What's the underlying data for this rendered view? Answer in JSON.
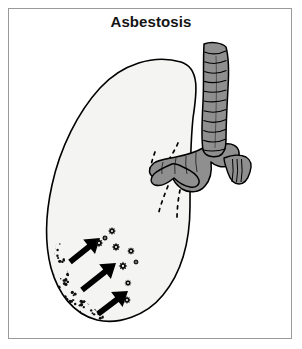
{
  "figure": {
    "title": "Asbestosis",
    "caption_text": "Asbestosis",
    "background_color": "#ffffff",
    "frame_border_color": "#9a9a9a",
    "title_color": "#141414"
  },
  "colors": {
    "lung_fill": "#f4f4f2",
    "lung_outline": "#000000",
    "airway_fill": "#8f8f8f",
    "airway_outline": "#000000",
    "airway_ring_line": "#000000",
    "fibrosis_stipple": "#101010",
    "arrow_fill": "#000000",
    "nodule_fill": "#0d0d0d",
    "nodule_center": "#f4f4f2",
    "dashed_airway_line": "#000000"
  },
  "anatomy": {
    "lung": {
      "label": "left lung (coronal view)",
      "fill": "#f4f4f2",
      "stroke": "#000000",
      "stroke_width": 1.6,
      "path": "M 181 62 C 200 68 197 92 193 118 C 190 148 190 178 190 206 C 190 240 182 272 163 295 C 146 316 118 325 97 320 C 73 314 58 293 51 268 C 44 241 46 212 52 185 C 60 148 78 112 100 88 C 122 64 154 54 181 62 Z"
    },
    "trachea": {
      "label": "trachea",
      "fill": "#8f8f8f",
      "stroke": "#000000",
      "path": "M 204 44 C 212 41 222 43 226 47 C 229 58 229 72 228 88 C 227 106 226 124 226 140 C 226 148 224 154 219 156 C 212 158 205 156 203 150 C 201 138 202 120 203 102 C 204 84 203 62 204 44 Z",
      "ring_count": 11
    },
    "carina": {
      "label": "carina / tracheal bifurcation",
      "fill": "#8f8f8f",
      "stroke": "#000000",
      "path": "M 203 148 C 196 152 186 155 176 157 C 166 159 158 160 154 163 C 149 167 148 173 152 176 C 157 179 164 176 170 172 C 172 178 176 185 182 189 C 190 194 200 192 205 186 C 211 179 212 170 211 162 C 215 166 222 168 229 166 C 236 164 240 158 239 152 C 238 146 232 143 225 144 C 217 145 209 146 203 148 Z"
    },
    "left_main_bronchus": {
      "label": "left main bronchus (entering lung hilum)",
      "fill": "#8f8f8f",
      "stroke": "#000000",
      "path": "M 172 164 C 165 167 158 170 154 174 C 150 178 150 183 155 185 C 161 187 168 183 174 178 C 178 182 184 186 190 187 C 196 188 200 185 199 180 C 197 174 190 170 183 167 C 179 165 175 163 172 164 Z"
    },
    "right_main_bronchus": {
      "label": "right main bronchus",
      "fill": "#8f8f8f",
      "stroke": "#000000",
      "path": "M 224 158 C 231 155 240 154 246 157 C 251 160 252 166 250 172 C 248 179 244 184 239 184 C 234 184 230 179 228 173 C 226 167 224 162 224 158 Z",
      "ring_count": 3
    },
    "intrapulmonary_airways": {
      "label": "dashed intrapulmonary bronchi",
      "stroke": "#000000",
      "dash_pattern": "3 5",
      "paths": [
        "M 178 143 C 174 152 169 160 163 167",
        "M 155 152 C 152 160 150 168 149 175",
        "M 168 186 C 164 196 160 206 158 216",
        "M 180 190 C 178 200 177 210 177 219"
      ]
    }
  },
  "pathology": {
    "fibrosis_band": {
      "label": "basal subpleural fibrosis (stippled band)",
      "description": "dense speckled fibrotic thickening along lower-left pleural border",
      "dot_color": "#101010",
      "region_path": "M 56 245 C 52 264 54 283 62 298 C 70 313 84 321 98 321 C 104 321 106 316 101 313 C 88 306 77 294 70 278 C 64 262 63 250 63 241 C 63 236 57 238 56 245 Z",
      "dot_count": 300
    },
    "arrows": {
      "label": "arrows indicating spread of fibrosis",
      "count": 3,
      "fill": "#000000",
      "direction": "lower-left to upper-right",
      "items": [
        {
          "x1": 70,
          "y1": 262,
          "x2": 100,
          "y2": 238,
          "width": 7
        },
        {
          "x1": 82,
          "y1": 290,
          "x2": 116,
          "y2": 263,
          "width": 7
        },
        {
          "x1": 98,
          "y1": 314,
          "x2": 128,
          "y2": 291,
          "width": 7
        }
      ]
    },
    "nodules": {
      "label": "asbestos bodies / fibrotic nodules",
      "count": 9,
      "fill": "#0d0d0d",
      "center_fill": "#f4f4f2",
      "items": [
        {
          "cx": 112,
          "cy": 231,
          "r": 4.0
        },
        {
          "cx": 99,
          "cy": 243,
          "r": 4.2
        },
        {
          "cx": 116,
          "cy": 247,
          "r": 4.2
        },
        {
          "cx": 131,
          "cy": 251,
          "r": 3.8
        },
        {
          "cx": 123,
          "cy": 266,
          "r": 4.4
        },
        {
          "cx": 128,
          "cy": 283,
          "r": 3.6
        },
        {
          "cx": 127,
          "cy": 300,
          "r": 3.9
        },
        {
          "cx": 105,
          "cy": 238,
          "r": 3.2
        },
        {
          "cx": 136,
          "cy": 262,
          "r": 3.0
        }
      ]
    }
  }
}
